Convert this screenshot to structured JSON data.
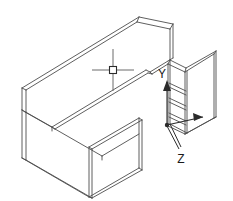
{
  "drawing": {
    "title": "L-shaped desk isometric wireframe",
    "subject": "office-desk",
    "projection": "isometric",
    "line_color": "#4d4d4d",
    "heavy_line_color": "#2b2b2b",
    "background_color": "#ffffff"
  },
  "ucs_indicator": {
    "name": "ucs-axis-icon",
    "axes": [
      {
        "id": "x",
        "label": "",
        "direction": "right",
        "arrow": "filled"
      },
      {
        "id": "y",
        "label": "Y",
        "direction": "up",
        "arrow": "filled"
      },
      {
        "id": "z",
        "label": "Z",
        "direction": "down-left",
        "arrow": "leader"
      }
    ],
    "labels": {
      "y": "Y",
      "z": "Z"
    }
  },
  "cursor": {
    "name": "crosshair-cursor",
    "type": "crosshair-with-pickbox",
    "x": 113,
    "y": 70,
    "pickbox_size": 7
  },
  "geometry": {
    "parts": [
      {
        "name": "desk-top-return",
        "label": "Return worktop"
      },
      {
        "name": "desk-top-main",
        "label": "Main worktop"
      },
      {
        "name": "modesty-panel-left",
        "label": "Left modesty panel"
      },
      {
        "name": "end-panel-front",
        "label": "Front end panel"
      },
      {
        "name": "pedestal-right",
        "label": "Right pedestal"
      },
      {
        "name": "drawer-fronts",
        "label": "Drawer fronts"
      }
    ]
  }
}
